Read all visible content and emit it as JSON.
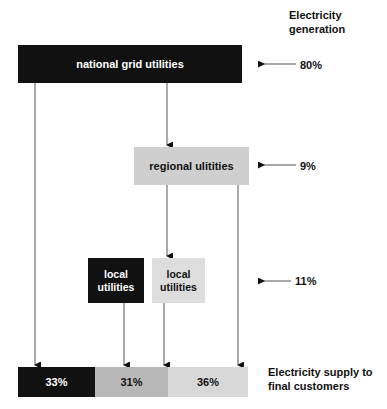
{
  "diagram": {
    "title_right_top": "Electricity\ngeneration",
    "title_right_bottom": "Electricity supply to\nfinal customers",
    "nodes": [
      {
        "id": "national",
        "label": "national grid utilities",
        "shade": "dark"
      },
      {
        "id": "regional",
        "label": "regional  ulitities",
        "shade": "mid"
      },
      {
        "id": "local_dark",
        "label": "local\nutilities",
        "shade": "dark"
      },
      {
        "id": "local_light",
        "label": "local\nutilities",
        "shade": "light"
      }
    ],
    "rates": [
      {
        "id": "generation",
        "value": "80%"
      },
      {
        "id": "regional",
        "value": "9%"
      },
      {
        "id": "local",
        "value": "11%"
      }
    ],
    "bar_segments": [
      {
        "label": "33%",
        "shade": "dark"
      },
      {
        "label": "31%",
        "shade": "medium"
      },
      {
        "label": "36%",
        "shade": "light"
      }
    ]
  },
  "chart_data": {
    "type": "diagram",
    "headings": {
      "top_right": "Electricity generation",
      "bottom_right": "Electricity supply to final customers"
    },
    "generation_shares": {
      "national grid utilities": 80,
      "regional ulitities": 9,
      "local utilities": 11
    },
    "supply_shares": {
      "national grid utilities": 33,
      "regional ulitities": 31,
      "local utilities": 36
    },
    "flows": [
      {
        "from": "national grid utilities",
        "to": "final customers",
        "share": 33
      },
      {
        "from": "national grid utilities",
        "to": "regional ulitities"
      },
      {
        "from": "regional ulitities",
        "to": "local utilities"
      },
      {
        "from": "regional ulitities",
        "to": "final customers",
        "share": 36
      },
      {
        "from": "local utilities (dark)",
        "to": "final customers",
        "share": 31
      },
      {
        "from": "local utilities (light)",
        "to": "final customers"
      }
    ],
    "colors": {
      "dark": "#111111",
      "medium": "#b8b8b8",
      "light": "#d8d8d8"
    }
  }
}
